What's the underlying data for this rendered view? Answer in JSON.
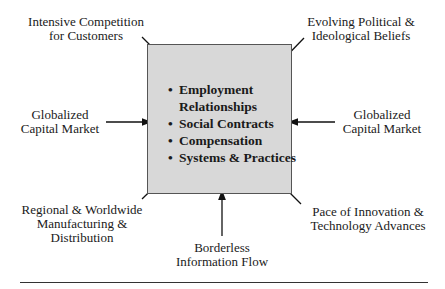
{
  "diagram": {
    "center": {
      "items": [
        {
          "lines": [
            "Employment",
            "Relationships"
          ]
        },
        {
          "lines": [
            "Social Contracts"
          ]
        },
        {
          "lines": [
            "Compensation"
          ]
        },
        {
          "lines": [
            "Systems & Practices"
          ]
        }
      ],
      "fill_color": "#d8d8d8"
    },
    "forces": {
      "top_left": {
        "lines": [
          "Intensive Competition",
          "for Customers"
        ]
      },
      "top_right": {
        "lines": [
          "Evolving Political &",
          "Ideological Beliefs"
        ]
      },
      "left": {
        "lines": [
          "Globalized",
          "Capital Market"
        ]
      },
      "right": {
        "lines": [
          "Globalized",
          "Capital Market"
        ]
      },
      "bottom_left": {
        "lines": [
          "Regional & Worldwide",
          "Manufacturing &",
          "Distribution"
        ]
      },
      "bottom": {
        "lines": [
          "Borderless",
          "Information Flow"
        ]
      },
      "bottom_right": {
        "lines": [
          "Pace of Innovation &",
          "Technology Advances"
        ]
      }
    }
  }
}
